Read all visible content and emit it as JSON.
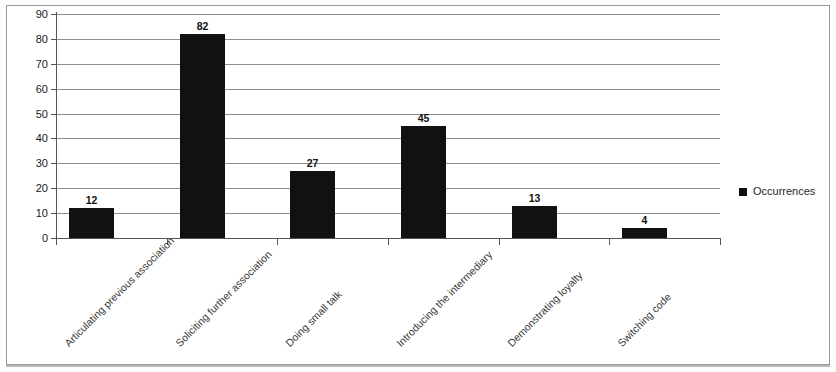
{
  "chart_data": {
    "type": "bar",
    "title": "",
    "xlabel": "",
    "ylabel": "",
    "categories": [
      "Articulating previous association",
      "Soliciting further association",
      "Doing small talk",
      "Introducing the intermediary",
      "Demonstrating loyalty",
      "Switching code"
    ],
    "series": [
      {
        "name": "Occurrences",
        "values": [
          12,
          82,
          27,
          45,
          13,
          4
        ],
        "color": "#111111"
      }
    ],
    "values": [
      12,
      82,
      27,
      45,
      13,
      4
    ],
    "data_labels": [
      "12",
      "82",
      "27",
      "45",
      "13",
      "4"
    ],
    "ylim": [
      0,
      90
    ],
    "ytick_step": 10,
    "yticks": [
      "90",
      "80",
      "70",
      "60",
      "50",
      "40",
      "30",
      "20",
      "10",
      "0"
    ],
    "grid": true,
    "grid_axis": "y",
    "legend": {
      "position": "right",
      "entries": [
        {
          "label": "Occurrences",
          "color": "#111111",
          "marker": "square"
        }
      ]
    }
  }
}
